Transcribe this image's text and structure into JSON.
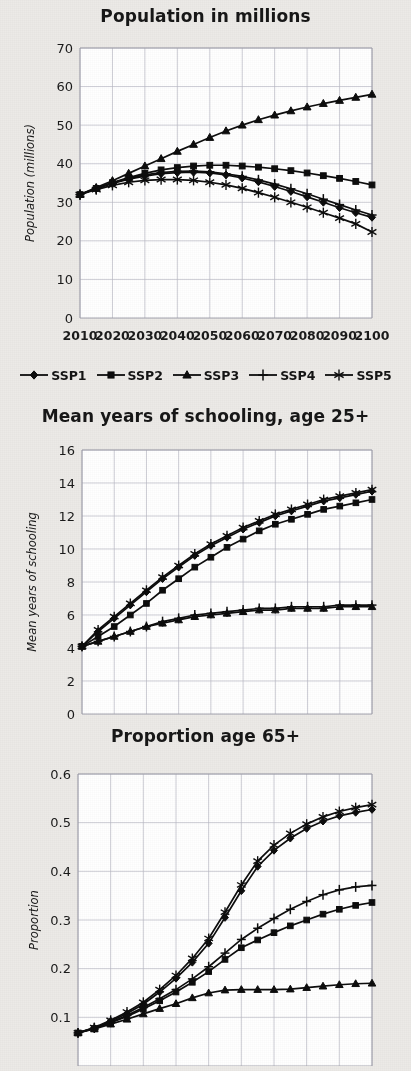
{
  "document": {
    "background_color": "#eceae7",
    "ink_color": "#0d0d0d",
    "gridline_color": "#b9b9c4"
  },
  "legend": {
    "name": "ssp-scenario-legend",
    "items": [
      {
        "label": "SSP1",
        "marker": "diamond"
      },
      {
        "label": "SSP2",
        "marker": "square"
      },
      {
        "label": "SSP3",
        "marker": "triangle"
      },
      {
        "label": "SSP4",
        "marker": "plus"
      },
      {
        "label": "SSP5",
        "marker": "asterisk"
      }
    ]
  },
  "chart_data": [
    {
      "id": "population",
      "type": "line",
      "title": "Population in millions",
      "xlabel": "",
      "ylabel": "Population (millions)",
      "x": [
        2010,
        2015,
        2020,
        2025,
        2030,
        2035,
        2040,
        2045,
        2050,
        2055,
        2060,
        2065,
        2070,
        2075,
        2080,
        2085,
        2090,
        2095,
        2100
      ],
      "xticks": [
        2010,
        2020,
        2030,
        2040,
        2050,
        2060,
        2070,
        2080,
        2090,
        2100
      ],
      "yticks": [
        0,
        10,
        20,
        30,
        40,
        50,
        60,
        70
      ],
      "xlim": [
        2010,
        2100
      ],
      "ylim": [
        0,
        70
      ],
      "grid": true,
      "legend_position": "below",
      "series": [
        {
          "name": "SSP1",
          "marker": "diamond",
          "values": [
            32.0,
            33.5,
            34.9,
            36.0,
            36.8,
            37.4,
            37.7,
            37.8,
            37.6,
            37.1,
            36.3,
            35.3,
            34.1,
            32.8,
            31.4,
            30.0,
            28.6,
            27.3,
            26.1
          ]
        },
        {
          "name": "SSP2",
          "marker": "square",
          "values": [
            32.0,
            33.6,
            35.1,
            36.4,
            37.5,
            38.4,
            39.0,
            39.4,
            39.6,
            39.6,
            39.4,
            39.1,
            38.7,
            38.2,
            37.6,
            36.9,
            36.2,
            35.4,
            34.5
          ]
        },
        {
          "name": "SSP3",
          "marker": "triangle",
          "values": [
            32.0,
            33.8,
            35.6,
            37.5,
            39.4,
            41.3,
            43.2,
            45.0,
            46.8,
            48.5,
            50.0,
            51.4,
            52.6,
            53.7,
            54.7,
            55.6,
            56.4,
            57.2,
            58.0
          ]
        },
        {
          "name": "SSP4",
          "marker": "plus",
          "values": [
            32.0,
            33.5,
            35.0,
            36.2,
            37.1,
            37.7,
            38.0,
            38.1,
            37.9,
            37.4,
            36.7,
            35.8,
            34.7,
            33.5,
            32.2,
            30.8,
            29.4,
            28.0,
            26.7
          ]
        },
        {
          "name": "SSP5",
          "marker": "asterisk",
          "values": [
            32.0,
            33.3,
            34.4,
            35.2,
            35.7,
            35.9,
            35.9,
            35.7,
            35.2,
            34.5,
            33.6,
            32.5,
            31.3,
            30.0,
            28.7,
            27.3,
            25.9,
            24.4,
            22.3
          ]
        }
      ]
    },
    {
      "id": "schooling",
      "type": "line",
      "title": "Mean years of schooling, age 25+",
      "xlabel": "",
      "ylabel": "Mean years of schooling",
      "x": [
        2010,
        2015,
        2020,
        2025,
        2030,
        2035,
        2040,
        2045,
        2050,
        2055,
        2060,
        2065,
        2070,
        2075,
        2080,
        2085,
        2090,
        2095,
        2100
      ],
      "xticks": [
        2010,
        2020,
        2030,
        2040,
        2050,
        2060,
        2070,
        2080,
        2090,
        2100
      ],
      "yticks": [
        0,
        2,
        4,
        6,
        8,
        10,
        12,
        14,
        16
      ],
      "xlim": [
        2010,
        2100
      ],
      "ylim": [
        0,
        16
      ],
      "grid": true,
      "legend_position": "none",
      "series": [
        {
          "name": "SSP1",
          "marker": "diamond",
          "values": [
            4.1,
            5.0,
            5.8,
            6.6,
            7.4,
            8.2,
            8.9,
            9.6,
            10.2,
            10.7,
            11.2,
            11.6,
            12.0,
            12.3,
            12.6,
            12.9,
            13.1,
            13.3,
            13.5
          ]
        },
        {
          "name": "SSP2",
          "marker": "square",
          "values": [
            4.1,
            4.7,
            5.3,
            6.0,
            6.7,
            7.5,
            8.2,
            8.9,
            9.5,
            10.1,
            10.6,
            11.1,
            11.5,
            11.8,
            12.1,
            12.4,
            12.6,
            12.8,
            13.0
          ]
        },
        {
          "name": "SSP3",
          "marker": "triangle",
          "values": [
            4.1,
            4.4,
            4.7,
            5.0,
            5.3,
            5.5,
            5.7,
            5.9,
            6.0,
            6.1,
            6.2,
            6.3,
            6.3,
            6.4,
            6.4,
            6.4,
            6.5,
            6.5,
            6.5
          ]
        },
        {
          "name": "SSP4",
          "marker": "plus",
          "values": [
            4.1,
            4.4,
            4.7,
            5.0,
            5.3,
            5.6,
            5.8,
            6.0,
            6.1,
            6.2,
            6.3,
            6.4,
            6.4,
            6.5,
            6.5,
            6.5,
            6.6,
            6.6,
            6.6
          ]
        },
        {
          "name": "SSP5",
          "marker": "asterisk",
          "values": [
            4.1,
            5.1,
            5.9,
            6.7,
            7.5,
            8.3,
            9.0,
            9.7,
            10.3,
            10.8,
            11.3,
            11.7,
            12.1,
            12.4,
            12.7,
            13.0,
            13.2,
            13.4,
            13.6
          ]
        }
      ]
    },
    {
      "id": "proportion",
      "type": "line",
      "title": "Proportion age 65+",
      "xlabel": "",
      "ylabel": "Proportion",
      "x": [
        2010,
        2015,
        2020,
        2025,
        2030,
        2035,
        2040,
        2045,
        2050,
        2055,
        2060,
        2065,
        2070,
        2075,
        2080,
        2085,
        2090,
        2095,
        2100
      ],
      "xticks": [
        2010,
        2020,
        2030,
        2040,
        2050,
        2060,
        2070,
        2080,
        2090,
        2100
      ],
      "yticks": [
        0.1,
        0.2,
        0.3,
        0.4,
        0.5,
        0.6
      ],
      "xlim": [
        2010,
        2100
      ],
      "ylim": [
        0.0,
        0.6
      ],
      "grid": true,
      "legend_position": "none",
      "cropped_bottom": true,
      "series": [
        {
          "name": "SSP1",
          "marker": "diamond",
          "values": [
            0.068,
            0.078,
            0.092,
            0.108,
            0.127,
            0.152,
            0.18,
            0.213,
            0.252,
            0.305,
            0.36,
            0.41,
            0.443,
            0.468,
            0.488,
            0.503,
            0.514,
            0.521,
            0.527
          ]
        },
        {
          "name": "SSP2",
          "marker": "square",
          "values": [
            0.068,
            0.077,
            0.089,
            0.102,
            0.117,
            0.134,
            0.152,
            0.172,
            0.194,
            0.219,
            0.243,
            0.259,
            0.274,
            0.288,
            0.3,
            0.312,
            0.322,
            0.33,
            0.336
          ]
        },
        {
          "name": "SSP3",
          "marker": "triangle",
          "values": [
            0.068,
            0.076,
            0.086,
            0.096,
            0.107,
            0.118,
            0.128,
            0.14,
            0.15,
            0.156,
            0.157,
            0.157,
            0.157,
            0.158,
            0.161,
            0.164,
            0.167,
            0.169,
            0.17
          ]
        },
        {
          "name": "SSP4",
          "marker": "plus",
          "values": [
            0.068,
            0.078,
            0.09,
            0.104,
            0.12,
            0.138,
            0.157,
            0.179,
            0.204,
            0.232,
            0.26,
            0.283,
            0.303,
            0.322,
            0.338,
            0.352,
            0.362,
            0.368,
            0.371
          ]
        },
        {
          "name": "SSP5",
          "marker": "asterisk",
          "values": [
            0.068,
            0.079,
            0.094,
            0.111,
            0.131,
            0.157,
            0.186,
            0.221,
            0.262,
            0.316,
            0.372,
            0.421,
            0.454,
            0.478,
            0.497,
            0.512,
            0.523,
            0.531,
            0.537
          ]
        }
      ]
    }
  ]
}
